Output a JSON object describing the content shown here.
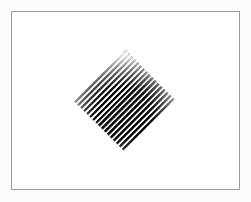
{
  "figure": {
    "title": "",
    "caption": "",
    "background_color": "#fcfcfc",
    "panel_color": "#ffffff",
    "frame_color": "#9a9a9a",
    "frame": {
      "x": 11,
      "y": 11,
      "width": 229,
      "height": 179,
      "border_width": 1
    }
  },
  "stimulus": {
    "name": "oriented-grating-patch",
    "shape": "square",
    "shape_rotation_deg": 45,
    "label": "",
    "center_x": 124,
    "center_y": 100,
    "width_px": 102,
    "height_px": 106,
    "side_px": 72,
    "grating": {
      "pattern": "square-wave",
      "orientation_deg": 45,
      "orientation_label": "stripes parallel to the upper-right edge",
      "period_px": 4.2,
      "stripe_count": 24,
      "duty_cycle": 0.5,
      "light_color": "#ffffff",
      "dark_color": "#000000",
      "mid_color": "#3a3a3a",
      "contrast": 1.0,
      "edge_falloff": "soft"
    }
  },
  "chart_data": {
    "type": "heatmap",
    "title": "",
    "xlabel": "",
    "ylabel": "",
    "categories": [],
    "values": [],
    "grid": false,
    "legend": false
  }
}
